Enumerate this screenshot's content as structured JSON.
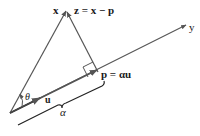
{
  "diagram": {
    "labels": {
      "x": "x",
      "z": "z = x − p",
      "y": "y",
      "p": "p = αu",
      "u": "u",
      "theta": "θ",
      "alpha": "α"
    },
    "colors": {
      "line": "#555555",
      "text": "#1a1a1a",
      "background": "#ffffff"
    },
    "points": {
      "origin": [
        10,
        113
      ],
      "x_tip": [
        66,
        10
      ],
      "p": [
        98,
        72
      ],
      "y_end": [
        186,
        25
      ],
      "u_tip": [
        38,
        99
      ]
    }
  }
}
